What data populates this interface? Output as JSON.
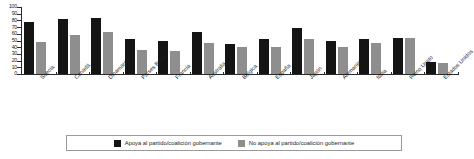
{
  "chart_data": {
    "type": "bar",
    "title": "",
    "subtitle": "",
    "xlabel": "",
    "ylabel": "",
    "ylim": [
      0,
      100
    ],
    "yticks": [
      0,
      10,
      20,
      30,
      40,
      50,
      60,
      70,
      80,
      90,
      100
    ],
    "grid": false,
    "legend_position": "bottom",
    "categories": [
      "Suecia",
      "Canadá",
      "Dinamarca",
      "Países Bajos",
      "Francia",
      "Australia",
      "Bélgica",
      "España",
      "Japón",
      "Alemania",
      "Italia",
      "Reino Unido",
      "Estados Unidos"
    ],
    "series": [
      {
        "name": "Apoya al partido/coalición gobernante",
        "color": "#141414",
        "values": [
          78,
          82,
          83,
          52,
          49,
          62,
          45,
          52,
          68,
          49,
          52,
          54,
          18
        ]
      },
      {
        "name": "No apoya al partido/coalición gobernante",
        "color": "#8e8e8e",
        "values": [
          48,
          58,
          62,
          36,
          34,
          46,
          40,
          41,
          52,
          41,
          46,
          54,
          16
        ]
      }
    ]
  },
  "legend": {
    "entries": [
      {
        "label": "Apoya al partido/coalición gobernante",
        "swatch": "black-square-icon"
      },
      {
        "label": "No apoya al partido/coalición gobernante",
        "swatch": "gray-square-icon"
      }
    ]
  },
  "colors": {
    "support": "#141414",
    "nosupport": "#8e8e8e",
    "axis": "#2b2b2b",
    "legend_border": "#9a9a9a",
    "background": "#ffffff"
  }
}
